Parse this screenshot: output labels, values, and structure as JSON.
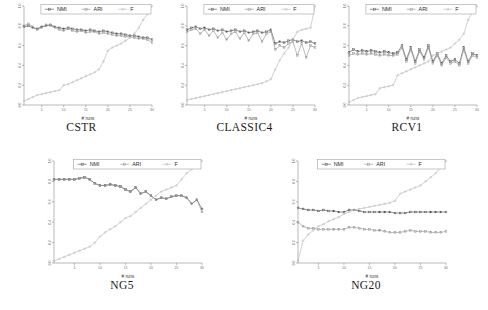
{
  "figure": {
    "axis": {
      "xlabel": "# runs",
      "xticks": [
        "5",
        "10",
        "15",
        "20",
        "25",
        "30"
      ],
      "yticks": [
        "1.0",
        "0.8",
        "0.6",
        "0.4",
        "0.2",
        "0.0"
      ],
      "xlim": [
        1,
        30
      ],
      "ylim": [
        0.0,
        1.0
      ]
    },
    "legend": {
      "nmi": "NMI",
      "ari": "ARI",
      "f": "F"
    },
    "colors": {
      "nmi": "#4d4d4d",
      "ari": "#8f8f8f",
      "f": "#b5b5b5",
      "axis": "#8a8a8a",
      "text": "#2a2a2a"
    },
    "captions": {
      "cstr": "CSTR",
      "classic4": "CLASSIC4",
      "rcv1": "RCV1",
      "ng5": "NG5",
      "ng20": "NG20"
    }
  },
  "chart_data": [
    {
      "type": "line",
      "title": "CSTR",
      "xlabel": "# runs",
      "ylabel": "",
      "xlim": [
        1,
        30
      ],
      "ylim": [
        0.0,
        1.0
      ],
      "grid": false,
      "legend_position": "top",
      "x": [
        1,
        2,
        3,
        4,
        5,
        6,
        7,
        8,
        9,
        10,
        11,
        12,
        13,
        14,
        15,
        16,
        17,
        18,
        19,
        20,
        21,
        22,
        23,
        24,
        25,
        26,
        27,
        28,
        29,
        30
      ],
      "series": [
        {
          "name": "NMI",
          "values": [
            0.79,
            0.8,
            0.78,
            0.77,
            0.79,
            0.8,
            0.81,
            0.79,
            0.78,
            0.77,
            0.78,
            0.77,
            0.76,
            0.76,
            0.75,
            0.76,
            0.75,
            0.74,
            0.75,
            0.74,
            0.73,
            0.72,
            0.72,
            0.71,
            0.7,
            0.7,
            0.69,
            0.68,
            0.68,
            0.66
          ]
        },
        {
          "name": "ARI",
          "values": [
            0.8,
            0.82,
            0.79,
            0.76,
            0.78,
            0.81,
            0.8,
            0.78,
            0.76,
            0.75,
            0.77,
            0.75,
            0.74,
            0.75,
            0.73,
            0.74,
            0.74,
            0.72,
            0.73,
            0.72,
            0.71,
            0.7,
            0.7,
            0.69,
            0.69,
            0.68,
            0.67,
            0.67,
            0.66,
            0.63
          ]
        },
        {
          "name": "F",
          "values": [
            0.04,
            0.06,
            0.08,
            0.1,
            0.11,
            0.12,
            0.13,
            0.14,
            0.15,
            0.2,
            0.21,
            0.23,
            0.25,
            0.27,
            0.29,
            0.31,
            0.33,
            0.36,
            0.44,
            0.55,
            0.58,
            0.6,
            0.62,
            0.65,
            0.68,
            0.72,
            0.78,
            0.86,
            0.92,
            1.0
          ]
        }
      ]
    },
    {
      "type": "line",
      "title": "CLASSIC4",
      "xlabel": "# runs",
      "ylabel": "",
      "xlim": [
        1,
        30
      ],
      "ylim": [
        0.0,
        1.0
      ],
      "grid": false,
      "legend_position": "top",
      "x": [
        1,
        2,
        3,
        4,
        5,
        6,
        7,
        8,
        9,
        10,
        11,
        12,
        13,
        14,
        15,
        16,
        17,
        18,
        19,
        20,
        21,
        22,
        23,
        24,
        25,
        26,
        27,
        28,
        29,
        30
      ],
      "series": [
        {
          "name": "NMI",
          "values": [
            0.76,
            0.78,
            0.79,
            0.77,
            0.78,
            0.76,
            0.77,
            0.75,
            0.76,
            0.74,
            0.75,
            0.76,
            0.74,
            0.75,
            0.73,
            0.74,
            0.75,
            0.73,
            0.74,
            0.76,
            0.62,
            0.64,
            0.63,
            0.65,
            0.66,
            0.64,
            0.65,
            0.63,
            0.64,
            0.62
          ]
        },
        {
          "name": "ARI",
          "values": [
            0.74,
            0.76,
            0.77,
            0.72,
            0.76,
            0.7,
            0.75,
            0.68,
            0.73,
            0.66,
            0.72,
            0.74,
            0.67,
            0.73,
            0.65,
            0.72,
            0.73,
            0.64,
            0.72,
            0.74,
            0.56,
            0.6,
            0.58,
            0.62,
            0.64,
            0.5,
            0.62,
            0.48,
            0.6,
            0.58
          ]
        },
        {
          "name": "F",
          "values": [
            0.05,
            0.06,
            0.07,
            0.08,
            0.09,
            0.1,
            0.11,
            0.12,
            0.13,
            0.14,
            0.15,
            0.16,
            0.17,
            0.18,
            0.19,
            0.2,
            0.21,
            0.22,
            0.24,
            0.26,
            0.36,
            0.45,
            0.52,
            0.58,
            0.66,
            0.74,
            0.76,
            0.77,
            0.78,
            1.0
          ]
        }
      ]
    },
    {
      "type": "line",
      "title": "RCV1",
      "xlabel": "# runs",
      "ylabel": "",
      "xlim": [
        1,
        30
      ],
      "ylim": [
        0.0,
        1.0
      ],
      "grid": false,
      "legend_position": "top",
      "x": [
        1,
        2,
        3,
        4,
        5,
        6,
        7,
        8,
        9,
        10,
        11,
        12,
        13,
        14,
        15,
        16,
        17,
        18,
        19,
        20,
        21,
        22,
        23,
        24,
        25,
        26,
        27,
        28,
        29,
        30
      ],
      "series": [
        {
          "name": "NMI",
          "values": [
            0.53,
            0.56,
            0.54,
            0.55,
            0.54,
            0.55,
            0.54,
            0.53,
            0.54,
            0.53,
            0.52,
            0.53,
            0.6,
            0.46,
            0.58,
            0.44,
            0.56,
            0.48,
            0.6,
            0.44,
            0.52,
            0.42,
            0.5,
            0.44,
            0.46,
            0.42,
            0.58,
            0.44,
            0.52,
            0.5
          ]
        },
        {
          "name": "ARI",
          "values": [
            0.5,
            0.52,
            0.51,
            0.52,
            0.51,
            0.52,
            0.51,
            0.5,
            0.51,
            0.5,
            0.5,
            0.51,
            0.58,
            0.44,
            0.56,
            0.42,
            0.54,
            0.46,
            0.58,
            0.42,
            0.5,
            0.4,
            0.48,
            0.42,
            0.44,
            0.4,
            0.56,
            0.42,
            0.5,
            0.48
          ]
        },
        {
          "name": "F",
          "values": [
            0.03,
            0.05,
            0.07,
            0.08,
            0.09,
            0.1,
            0.11,
            0.17,
            0.18,
            0.19,
            0.2,
            0.3,
            0.32,
            0.34,
            0.36,
            0.38,
            0.4,
            0.42,
            0.44,
            0.5,
            0.52,
            0.54,
            0.56,
            0.58,
            0.62,
            0.66,
            0.72,
            0.86,
            0.94,
            1.0
          ]
        }
      ]
    },
    {
      "type": "line",
      "title": "NG5",
      "xlabel": "# runs",
      "ylabel": "",
      "xlim": [
        1,
        30
      ],
      "ylim": [
        0.0,
        1.0
      ],
      "grid": false,
      "legend_position": "top",
      "x": [
        1,
        2,
        3,
        4,
        5,
        6,
        7,
        8,
        9,
        10,
        11,
        12,
        13,
        14,
        15,
        16,
        17,
        18,
        19,
        20,
        21,
        22,
        23,
        24,
        25,
        26,
        27,
        28,
        29,
        30
      ],
      "series": [
        {
          "name": "NMI",
          "values": [
            0.82,
            0.82,
            0.82,
            0.82,
            0.82,
            0.83,
            0.84,
            0.82,
            0.78,
            0.76,
            0.76,
            0.77,
            0.76,
            0.75,
            0.72,
            0.7,
            0.74,
            0.68,
            0.7,
            0.66,
            0.62,
            0.64,
            0.63,
            0.65,
            0.66,
            0.66,
            0.64,
            0.58,
            0.62,
            0.53
          ]
        },
        {
          "name": "ARI",
          "values": [
            0.82,
            0.82,
            0.82,
            0.82,
            0.82,
            0.83,
            0.84,
            0.82,
            0.78,
            0.76,
            0.76,
            0.77,
            0.76,
            0.75,
            0.72,
            0.7,
            0.74,
            0.68,
            0.7,
            0.66,
            0.62,
            0.64,
            0.63,
            0.65,
            0.66,
            0.66,
            0.64,
            0.58,
            0.62,
            0.5
          ]
        },
        {
          "name": "F",
          "values": [
            0.02,
            0.04,
            0.06,
            0.08,
            0.1,
            0.12,
            0.14,
            0.16,
            0.2,
            0.26,
            0.3,
            0.33,
            0.36,
            0.4,
            0.44,
            0.46,
            0.5,
            0.54,
            0.58,
            0.62,
            0.66,
            0.7,
            0.72,
            0.74,
            0.76,
            0.82,
            0.88,
            0.92,
            0.96,
            1.0
          ]
        }
      ]
    },
    {
      "type": "line",
      "title": "NG20",
      "xlabel": "# runs",
      "ylabel": "",
      "xlim": [
        1,
        30
      ],
      "ylim": [
        0.0,
        1.0
      ],
      "grid": false,
      "legend_position": "top",
      "x": [
        1,
        2,
        3,
        4,
        5,
        6,
        7,
        8,
        9,
        10,
        11,
        12,
        13,
        14,
        15,
        16,
        17,
        18,
        19,
        20,
        21,
        22,
        23,
        24,
        25,
        26,
        27,
        28,
        29,
        30
      ],
      "series": [
        {
          "name": "NMI",
          "values": [
            0.54,
            0.53,
            0.52,
            0.52,
            0.51,
            0.52,
            0.51,
            0.51,
            0.5,
            0.5,
            0.52,
            0.52,
            0.51,
            0.5,
            0.5,
            0.5,
            0.5,
            0.5,
            0.5,
            0.49,
            0.49,
            0.49,
            0.5,
            0.5,
            0.5,
            0.5,
            0.5,
            0.5,
            0.5,
            0.5
          ]
        },
        {
          "name": "ARI",
          "values": [
            0.4,
            0.36,
            0.34,
            0.34,
            0.33,
            0.33,
            0.33,
            0.33,
            0.33,
            0.33,
            0.35,
            0.35,
            0.34,
            0.33,
            0.33,
            0.32,
            0.32,
            0.31,
            0.3,
            0.3,
            0.3,
            0.31,
            0.32,
            0.31,
            0.31,
            0.31,
            0.3,
            0.3,
            0.3,
            0.31
          ]
        },
        {
          "name": "F",
          "values": [
            0.02,
            0.22,
            0.28,
            0.32,
            0.36,
            0.38,
            0.41,
            0.43,
            0.45,
            0.48,
            0.5,
            0.52,
            0.53,
            0.54,
            0.55,
            0.56,
            0.57,
            0.58,
            0.59,
            0.61,
            0.68,
            0.7,
            0.72,
            0.74,
            0.76,
            0.8,
            0.84,
            0.88,
            0.94,
            1.0
          ]
        }
      ]
    }
  ]
}
